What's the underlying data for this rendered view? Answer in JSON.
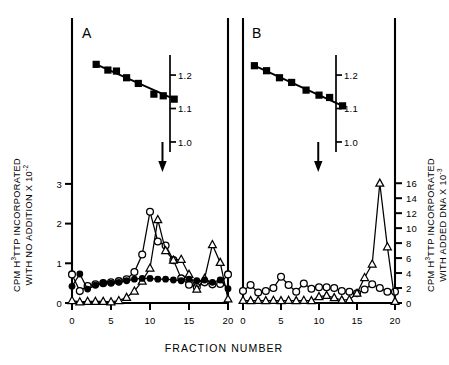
{
  "figure": {
    "xlabel": "FRACTION NUMBER",
    "left_axis_label_line1": "CPM H",
    "left_axis_label_sup1": "3",
    "left_axis_label_line1b": "TTP INCORPORATED",
    "left_axis_label_line2": "WITH NO ADDITION X 10",
    "left_axis_label_sup2": "-2",
    "right_axis_label_line1": "CPM H",
    "right_axis_label_sup1": "3",
    "right_axis_label_line1b": "TTP INCORPORATED",
    "right_axis_label_line2": "WITH ADDED DNA X 10",
    "right_axis_label_sup2": "-3"
  },
  "chart_data": [
    {
      "type": "line",
      "panel": "A",
      "title": "A",
      "xlabel": "FRACTION NUMBER",
      "ylabel": "CPM H3TTP INCORPORATED WITH NO ADDITION X 10-2",
      "xlim": [
        0,
        20
      ],
      "xticks": [
        0,
        5,
        10,
        15,
        20
      ],
      "xticklabels": [
        "0",
        "5",
        "10",
        "15",
        "20"
      ],
      "ylim": [
        0,
        3.3
      ],
      "yticks": [
        0,
        1,
        2,
        3
      ],
      "yticklabels": [
        "0",
        "1",
        "2",
        "3"
      ],
      "grid": false,
      "legend": "none",
      "density_axis": {
        "label": "density",
        "ticks": [
          1.0,
          1.1,
          1.2
        ],
        "ticklabels": [
          "1.0",
          "1.1",
          "1.2"
        ],
        "lim": [
          0.97,
          1.26
        ]
      },
      "annotations": [
        {
          "type": "arrow",
          "x": 11.6,
          "label": "down-arrow"
        }
      ],
      "series": [
        {
          "name": "density (filled squares, upper panel)",
          "marker": "filled-square",
          "axis": "density",
          "x": [
            3.1,
            4.6,
            5.7,
            7.0,
            8.5,
            10.5,
            11.7,
            13.1
          ],
          "values": [
            1.232,
            1.215,
            1.212,
            1.192,
            1.175,
            1.143,
            1.138,
            1.128
          ]
        },
        {
          "name": "open circles",
          "marker": "open-circle",
          "axis": "left",
          "x": [
            0,
            1,
            2,
            3,
            4,
            5,
            6,
            7,
            8,
            9,
            10,
            11,
            12,
            13,
            14,
            15,
            16,
            17,
            18,
            19,
            20
          ],
          "values": [
            0.72,
            0.3,
            0.43,
            0.47,
            0.5,
            0.52,
            0.55,
            0.6,
            0.78,
            1.22,
            2.3,
            1.55,
            1.45,
            1.08,
            0.62,
            0.46,
            0.4,
            0.52,
            0.47,
            0.48,
            0.72
          ]
        },
        {
          "name": "open triangles",
          "marker": "open-triangle",
          "axis": "left",
          "x": [
            0,
            1,
            2,
            3,
            4,
            5,
            6,
            7,
            8,
            9,
            10,
            11,
            12,
            13,
            14,
            15,
            16,
            17,
            18,
            19,
            20
          ],
          "values": [
            0.06,
            0.03,
            0.04,
            0.04,
            0.04,
            0.03,
            0.06,
            0.14,
            0.3,
            0.55,
            0.88,
            2.1,
            1.32,
            1.08,
            1.1,
            0.72,
            0.35,
            0.62,
            1.47,
            1.02,
            0.1
          ]
        },
        {
          "name": "filled circles",
          "marker": "filled-circle",
          "axis": "left",
          "x": [
            0,
            1,
            2,
            3,
            4,
            5,
            6,
            7,
            8,
            9,
            10,
            11,
            12,
            13,
            14,
            15,
            16,
            17,
            18,
            19,
            20
          ],
          "values": [
            0.42,
            0.73,
            0.35,
            0.45,
            0.5,
            0.5,
            0.52,
            0.56,
            0.6,
            0.62,
            0.62,
            0.6,
            0.6,
            0.58,
            0.56,
            0.6,
            0.56,
            0.58,
            0.52,
            0.58,
            0.36
          ]
        }
      ]
    },
    {
      "type": "line",
      "panel": "B",
      "title": "B",
      "xlabel": "FRACTION NUMBER",
      "ylabel": "CPM H3TTP INCORPORATED WITH ADDED DNA X 10-3",
      "xlim": [
        0,
        20
      ],
      "xticks": [
        0,
        5,
        10,
        15,
        20
      ],
      "xticklabels": [
        "0",
        "5",
        "10",
        "15",
        "20"
      ],
      "ylim": [
        0,
        17.5
      ],
      "yticks": [
        0,
        2,
        4,
        6,
        8,
        10,
        12,
        14,
        16
      ],
      "yticklabels": [
        "0",
        "2",
        "4",
        "6",
        "8",
        "10",
        "12",
        "14",
        "16"
      ],
      "grid": false,
      "legend": "none",
      "density_axis": {
        "label": "density",
        "ticks": [
          1.0,
          1.1,
          1.2
        ],
        "ticklabels": [
          "1.0",
          "1.1",
          "1.2"
        ],
        "lim": [
          0.97,
          1.26
        ]
      },
      "annotations": [
        {
          "type": "arrow",
          "x": 9.9,
          "label": "down-arrow"
        }
      ],
      "series": [
        {
          "name": "density (filled squares, upper panel)",
          "marker": "filled-square",
          "axis": "density",
          "x": [
            1.5,
            3.1,
            4.8,
            6.4,
            8.3,
            10.0,
            11.4,
            13.1
          ],
          "values": [
            1.228,
            1.213,
            1.192,
            1.178,
            1.155,
            1.14,
            1.133,
            1.108
          ]
        },
        {
          "name": "open circles",
          "marker": "open-circle",
          "axis": "right",
          "x": [
            0,
            1,
            2,
            3,
            4,
            5,
            6,
            7,
            8,
            9,
            10,
            11,
            12,
            13,
            14,
            15,
            16,
            17,
            18,
            19,
            20
          ],
          "values": [
            1.6,
            2.4,
            1.4,
            1.6,
            2.0,
            3.5,
            2.4,
            1.5,
            2.6,
            1.9,
            2.1,
            2.1,
            2.0,
            1.6,
            1.5,
            1.3,
            1.8,
            2.5,
            2.0,
            1.5,
            1.5
          ]
        },
        {
          "name": "open triangles",
          "marker": "open-triangle",
          "axis": "right",
          "x": [
            0,
            1,
            2,
            3,
            4,
            5,
            6,
            7,
            8,
            9,
            10,
            11,
            12,
            13,
            14,
            15,
            16,
            17,
            18,
            19,
            20
          ],
          "values": [
            0.35,
            0.3,
            0.35,
            0.3,
            0.35,
            0.3,
            0.35,
            0.3,
            0.35,
            0.3,
            0.85,
            1.0,
            0.7,
            0.4,
            0.45,
            1.3,
            3.4,
            5.2,
            16.0,
            7.5,
            0.2
          ]
        }
      ]
    }
  ]
}
